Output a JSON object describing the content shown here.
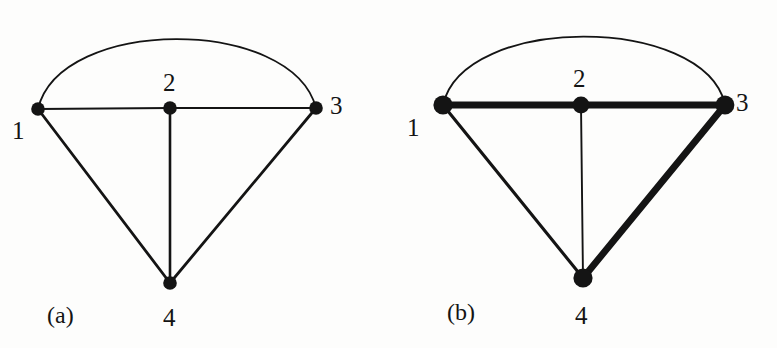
{
  "figure": {
    "background_color": "#fdfdfc",
    "ink_color": "#141414",
    "panels": [
      {
        "id": "a",
        "caption": "(a)",
        "description": "Undirected multigraph on four vertices drawn with uniform thin edges",
        "nodes": [
          {
            "id": "1",
            "label": "1",
            "x": 38,
            "y": 109
          },
          {
            "id": "2",
            "label": "2",
            "x": 170,
            "y": 108
          },
          {
            "id": "3",
            "label": "3",
            "x": 316,
            "y": 108
          },
          {
            "id": "4",
            "label": "4",
            "x": 170,
            "y": 283
          }
        ],
        "edges": [
          {
            "from": "1",
            "to": "3",
            "style": "arc",
            "weight": "thin",
            "label": ""
          },
          {
            "from": "1",
            "to": "2",
            "style": "straight",
            "weight": "thin",
            "label": ""
          },
          {
            "from": "2",
            "to": "3",
            "style": "straight",
            "weight": "thin",
            "label": ""
          },
          {
            "from": "1",
            "to": "4",
            "style": "straight",
            "weight": "medium",
            "label": ""
          },
          {
            "from": "2",
            "to": "4",
            "style": "straight",
            "weight": "medium",
            "label": ""
          },
          {
            "from": "3",
            "to": "4",
            "style": "straight",
            "weight": "medium",
            "label": ""
          }
        ]
      },
      {
        "id": "b",
        "caption": "(b)",
        "description": "Same multigraph with the path 1-2-3-4 emphasised in heavy stroke",
        "nodes": [
          {
            "id": "1",
            "label": "1",
            "x": 54,
            "y": 105
          },
          {
            "id": "2",
            "label": "2",
            "x": 192,
            "y": 105
          },
          {
            "id": "3",
            "label": "3",
            "x": 336,
            "y": 105
          },
          {
            "id": "4",
            "label": "4",
            "x": 194,
            "y": 278
          }
        ],
        "edges": [
          {
            "from": "1",
            "to": "3",
            "style": "arc",
            "weight": "thin",
            "label": ""
          },
          {
            "from": "1",
            "to": "2",
            "style": "straight",
            "weight": "bold",
            "label": ""
          },
          {
            "from": "2",
            "to": "3",
            "style": "straight",
            "weight": "bold",
            "label": ""
          },
          {
            "from": "1",
            "to": "4",
            "style": "straight",
            "weight": "medium",
            "label": ""
          },
          {
            "from": "2",
            "to": "4",
            "style": "straight",
            "weight": "thin",
            "label": ""
          },
          {
            "from": "3",
            "to": "4",
            "style": "straight",
            "weight": "bold",
            "label": ""
          }
        ]
      }
    ],
    "stroke_widths": {
      "thin": 1.8,
      "medium": 2.8,
      "bold": 6.5
    },
    "node_radii": {
      "normal": 6.5,
      "emphasised": 9.5
    }
  }
}
